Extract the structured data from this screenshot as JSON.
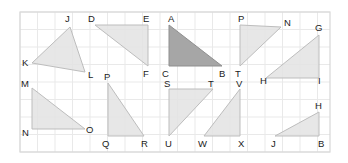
{
  "figure": {
    "canvas": {
      "width": 348,
      "height": 163
    },
    "background_color": "#ffffff",
    "frame": {
      "x": 20,
      "y": 12,
      "width": 310,
      "height": 140,
      "border_color": "#d8d8d8"
    },
    "grid": {
      "visible": true,
      "cell_size": 17.5,
      "line_color": "#e9e9e9",
      "columns": 18,
      "rows": 8
    },
    "colors": {
      "shape_fill_light": "#e3e3e3",
      "shape_fill_highlight": "#a6a6a6",
      "shape_stroke": "#bdbdbd",
      "shape_stroke_highlight": "#8f8f8f",
      "label_color": "#1b1b1b"
    },
    "triangles": [
      {
        "name": "JKL",
        "highlighted": false,
        "points": "70,27 32,63 85,72",
        "labels": [
          {
            "text": "J",
            "x": 65,
            "y": 22
          },
          {
            "text": "K",
            "x": 22,
            "y": 66
          },
          {
            "text": "L",
            "x": 88,
            "y": 78
          }
        ]
      },
      {
        "name": "DEF",
        "highlighted": false,
        "points": "95,25 148,25 148,66",
        "labels": [
          {
            "text": "D",
            "x": 88,
            "y": 22
          },
          {
            "text": "E",
            "x": 143,
            "y": 22
          },
          {
            "text": "F",
            "x": 143,
            "y": 77
          }
        ]
      },
      {
        "name": "ABC",
        "highlighted": true,
        "points": "169,25 222,66 169,66",
        "labels": [
          {
            "text": "A",
            "x": 168,
            "y": 22
          },
          {
            "text": "C",
            "x": 162,
            "y": 77
          },
          {
            "text": "B",
            "x": 219,
            "y": 77
          }
        ]
      },
      {
        "name": "PTN",
        "highlighted": false,
        "points": "240,25 281,27 240,66",
        "labels": [
          {
            "text": "P",
            "x": 238,
            "y": 22
          },
          {
            "text": "T",
            "x": 235,
            "y": 77
          },
          {
            "text": "N",
            "x": 284,
            "y": 26
          }
        ]
      },
      {
        "name": "GHI",
        "highlighted": false,
        "points": "319,35 319,78 266,78",
        "labels": [
          {
            "text": "G",
            "x": 315,
            "y": 31
          },
          {
            "text": "H",
            "x": 260,
            "y": 84
          },
          {
            "text": "I",
            "x": 318,
            "y": 84
          }
        ]
      },
      {
        "name": "MNO",
        "highlighted": false,
        "points": "32,88 32,129 85,129",
        "labels": [
          {
            "text": "M",
            "x": 21,
            "y": 87
          },
          {
            "text": "N",
            "x": 22,
            "y": 136
          },
          {
            "text": "O",
            "x": 86,
            "y": 133
          }
        ]
      },
      {
        "name": "PQR",
        "highlighted": false,
        "points": "108,83 108,136 144,136",
        "labels": [
          {
            "text": "P",
            "x": 104,
            "y": 80
          },
          {
            "text": "Q",
            "x": 102,
            "y": 147
          },
          {
            "text": "R",
            "x": 141,
            "y": 147
          }
        ]
      },
      {
        "name": "STU",
        "highlighted": false,
        "points": "169,89 213,89 169,136",
        "labels": [
          {
            "text": "S",
            "x": 164,
            "y": 87
          },
          {
            "text": "T",
            "x": 208,
            "y": 87
          },
          {
            "text": "U",
            "x": 165,
            "y": 147
          }
        ]
      },
      {
        "name": "VWX",
        "highlighted": false,
        "points": "240,89 240,136 204,136",
        "labels": [
          {
            "text": "V",
            "x": 236,
            "y": 87
          },
          {
            "text": "W",
            "x": 198,
            "y": 147
          },
          {
            "text": "X",
            "x": 238,
            "y": 147
          }
        ]
      },
      {
        "name": "JHB",
        "highlighted": false,
        "points": "319,112 319,136 275,136",
        "labels": [
          {
            "text": "H",
            "x": 315,
            "y": 109
          },
          {
            "text": "J",
            "x": 271,
            "y": 147
          },
          {
            "text": "B",
            "x": 318,
            "y": 147
          }
        ]
      }
    ]
  }
}
